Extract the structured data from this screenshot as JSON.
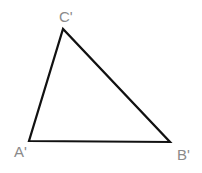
{
  "diagram": {
    "type": "triangle",
    "stroke_color": "#111111",
    "label_color": "#8a8a8a",
    "vertices": [
      {
        "id": "A",
        "label": "A'",
        "x": 29,
        "y": 141,
        "label_x": 14,
        "label_y": 157
      },
      {
        "id": "B",
        "label": "B'",
        "x": 170,
        "y": 142,
        "label_x": 177,
        "label_y": 160
      },
      {
        "id": "C",
        "label": "C'",
        "x": 63,
        "y": 29,
        "label_x": 59,
        "label_y": 22
      }
    ]
  }
}
